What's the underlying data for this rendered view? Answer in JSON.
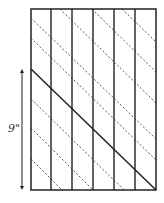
{
  "diagram": {
    "dimension_label": "9\"",
    "rect": {
      "x": 31,
      "y": 9,
      "w": 125,
      "h": 181
    },
    "vertical_lines_x": [
      51,
      72,
      93,
      114,
      135
    ],
    "solid_diagonal": {
      "x1": 31,
      "y1": 69,
      "x2": 156,
      "y2": 190
    },
    "dashed_diagonals": [
      {
        "x1": 31,
        "y1": 159,
        "x2": 62,
        "y2": 190
      },
      {
        "x1": 31,
        "y1": 128,
        "x2": 93,
        "y2": 190
      },
      {
        "x1": 31,
        "y1": 99,
        "x2": 124,
        "y2": 190
      },
      {
        "x1": 31,
        "y1": 38,
        "x2": 156,
        "y2": 160
      },
      {
        "x1": 31,
        "y1": 18,
        "x2": 156,
        "y2": 139
      },
      {
        "x1": 60,
        "y1": 9,
        "x2": 156,
        "y2": 103
      },
      {
        "x1": 92,
        "y1": 9,
        "x2": 156,
        "y2": 72
      },
      {
        "x1": 122,
        "y1": 9,
        "x2": 156,
        "y2": 42
      }
    ],
    "arrow": {
      "x": 22,
      "y1": 69,
      "y2": 190
    },
    "colors": {
      "line": "#222222",
      "dashed": "#444444"
    }
  }
}
